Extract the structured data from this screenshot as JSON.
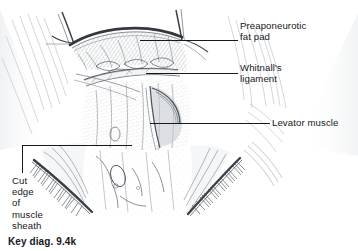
{
  "figure": {
    "caption": "Key diag. 9.4k",
    "background_color": "#ffffff",
    "ink_color": "#2b2f36",
    "label_color": "#15181c"
  },
  "labels": {
    "preaponeurotic": {
      "text": "Preaponeurotic\nfat pad",
      "line1": "Preaponeurotic",
      "line2": "fat pad"
    },
    "whitnall": {
      "text": "Whitnall's\nligament",
      "line1": "Whitnall's",
      "line2": "ligament"
    },
    "levator": {
      "text": "Levator muscle"
    },
    "cut_edge": {
      "text": "Cut\nedge\nof\nmuscle\nsheath",
      "line1": "Cut",
      "line2": "edge",
      "line3": "of",
      "line4": "muscle",
      "line5": "sheath"
    }
  },
  "leader_lines": [
    {
      "name": "preaponeurotic-leader",
      "from_x": 140,
      "from_y": 40,
      "to_x": 238,
      "to_y": 40
    },
    {
      "name": "whitnall-leader",
      "from_x": 146,
      "from_y": 73,
      "to_x": 238,
      "to_y": 73
    },
    {
      "name": "levator-leader",
      "from_x": 150,
      "from_y": 123,
      "to_x": 270,
      "to_y": 123
    },
    {
      "name": "cutedge-leader-horizontal",
      "from_x": 22,
      "from_y": 145,
      "to_x": 132,
      "to_y": 145
    },
    {
      "name": "cutedge-leader-vertical",
      "from_x": 22,
      "from_y": 145,
      "to_x": 22,
      "to_y": 173
    }
  ]
}
